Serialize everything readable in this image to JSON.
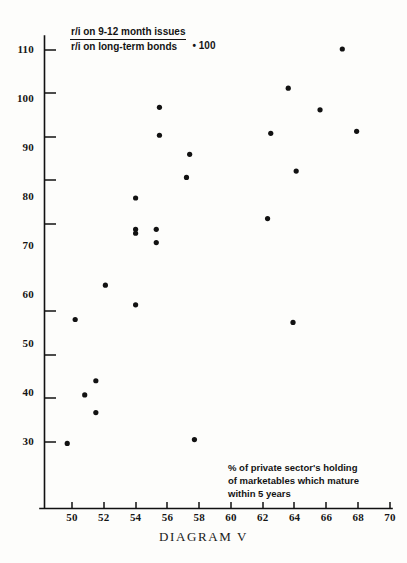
{
  "chart_data": {
    "type": "scatter",
    "title": "DIAGRAM V",
    "xlabel": "% of private sector's holding of marketables which mature within 5 years",
    "ylabel": "r/i on 9-12 month issues / r/i on long-term bonds * 100",
    "xlim": [
      48.6,
      70.6
    ],
    "ylim": [
      27.0,
      113.0
    ],
    "xticks": [
      50,
      52,
      54,
      56,
      58,
      60,
      62,
      64,
      66,
      68,
      70
    ],
    "yticks": [
      30,
      40,
      50,
      60,
      70,
      80,
      90,
      100,
      110
    ],
    "grid": false,
    "legend": "none",
    "points": [
      {
        "x": 49.7,
        "y": 29.7
      },
      {
        "x": 50.2,
        "y": 55.0
      },
      {
        "x": 50.8,
        "y": 39.6
      },
      {
        "x": 51.5,
        "y": 42.5
      },
      {
        "x": 51.5,
        "y": 36.0
      },
      {
        "x": 52.1,
        "y": 62.0
      },
      {
        "x": 54.0,
        "y": 58.0
      },
      {
        "x": 54.0,
        "y": 79.8
      },
      {
        "x": 54.0,
        "y": 73.4
      },
      {
        "x": 54.0,
        "y": 72.6
      },
      {
        "x": 55.3,
        "y": 73.4
      },
      {
        "x": 55.3,
        "y": 70.7
      },
      {
        "x": 55.5,
        "y": 98.3
      },
      {
        "x": 55.5,
        "y": 92.6
      },
      {
        "x": 57.2,
        "y": 84.0
      },
      {
        "x": 57.4,
        "y": 88.7
      },
      {
        "x": 57.7,
        "y": 30.5
      },
      {
        "x": 62.5,
        "y": 93.0
      },
      {
        "x": 62.3,
        "y": 75.6
      },
      {
        "x": 63.6,
        "y": 102.2
      },
      {
        "x": 63.9,
        "y": 54.4
      },
      {
        "x": 64.1,
        "y": 85.3
      },
      {
        "x": 65.6,
        "y": 97.8
      },
      {
        "x": 67.0,
        "y": 110.2
      },
      {
        "x": 67.9,
        "y": 93.4
      }
    ]
  },
  "legend": {
    "numerator": "r/i on 9-12 month issues",
    "denominator": "r/i on long-term bonds",
    "multiplier": "• 100"
  },
  "annotation": {
    "line1": "% of private sector's holding",
    "line2": "of marketables which mature",
    "line3": "within 5 years"
  },
  "axis_title": {
    "label": "DIAGRAM V"
  },
  "colors": {
    "axis": "#111111",
    "point": "#121212",
    "background": "#fdfdfb",
    "text": "#141414"
  }
}
